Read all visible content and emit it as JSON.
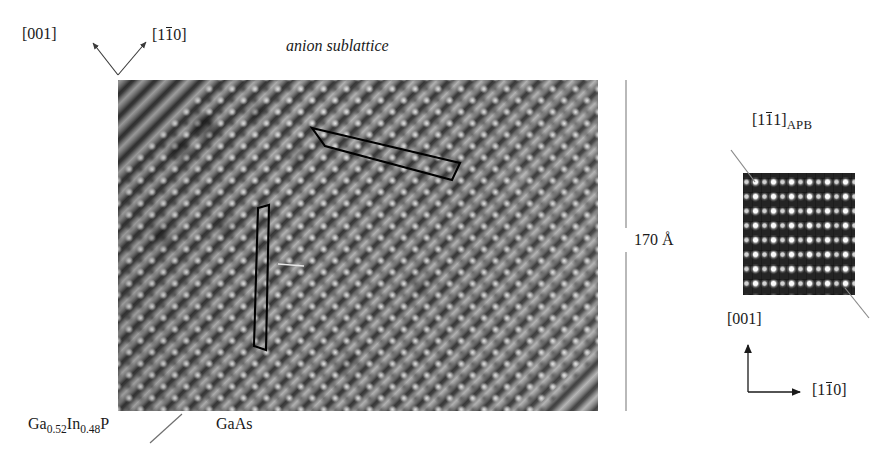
{
  "figure": {
    "caption_title": "anion sublattice",
    "scale_bar_label": "170 Å"
  },
  "main_panel": {
    "axis_label_vertical": "[001]",
    "axis_label_diagonal_prefix": "[1",
    "axis_label_diagonal_overbar": "1",
    "axis_label_diagonal_suffix": "0]",
    "material_left_a": "Ga",
    "material_left_sub_a": "0.52",
    "material_left_b": "In",
    "material_left_sub_b": "0.48",
    "material_left_c": "P",
    "material_right": "GaAs"
  },
  "inset_panel": {
    "apb_prefix": "[1",
    "apb_overbar": "1",
    "apb_mid": "1]",
    "apb_subscript": "APB",
    "axis_vertical": "[001]",
    "axis_horizontal_prefix": "[1",
    "axis_horizontal_overbar": "1",
    "axis_horizontal_suffix": "0]"
  },
  "colors": {
    "ink": "#1a1a1a",
    "leader": "#8a8a8a",
    "overlay": "#000000"
  }
}
